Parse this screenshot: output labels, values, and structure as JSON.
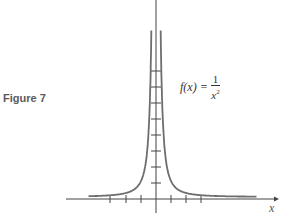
{
  "figure": {
    "label": "Figure 7",
    "formula_lhs": "f(x) =",
    "formula_num": "1",
    "formula_den": "x",
    "formula_exp": "2",
    "x_axis_label": "x"
  },
  "chart_data": {
    "type": "line",
    "xlabel": "x",
    "ylabel": "",
    "series": [
      {
        "name": "f(x) = 1/x^2",
        "function": "1/x^2"
      }
    ],
    "x_ticks": [
      -3,
      -2,
      -1,
      1,
      2,
      3
    ],
    "y_ticks": [
      1,
      2,
      3,
      4,
      5,
      6,
      7,
      8
    ],
    "xlim": [
      -4.3,
      5.5
    ],
    "ylim": [
      -0.8,
      12
    ],
    "grid": false,
    "legend": "annotation near curve",
    "colors": {
      "curve": "#6e6e6e",
      "axes": "#444444"
    }
  }
}
